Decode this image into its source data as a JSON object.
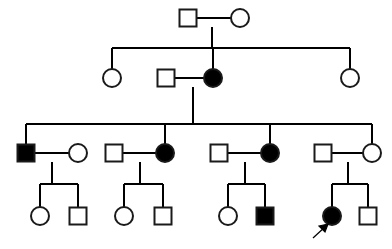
{
  "diagram": {
    "kind": "pedigree-chart",
    "title": "",
    "canvas": {
      "width": 392,
      "height": 249
    },
    "colors": {
      "background": "#ffffff",
      "line": "#000000",
      "symbol_stroke": "#1a1a1a",
      "affected_fill": "#000000",
      "unaffected_fill": "#ffffff"
    },
    "legend": {
      "square_meaning": "male",
      "circle_meaning": "female",
      "filled_meaning": "affected",
      "open_meaning": "unaffected",
      "arrow_meaning": "proband"
    },
    "generations": [
      {
        "id": "I",
        "label": "I",
        "y": 18,
        "individuals": [
          {
            "id": "I-1",
            "shape": "square",
            "sex": "male",
            "status": "unaffected",
            "cx": 188,
            "cy": 18
          },
          {
            "id": "I-2",
            "shape": "circle",
            "sex": "female",
            "status": "unaffected",
            "cx": 240,
            "cy": 18
          }
        ]
      },
      {
        "id": "II",
        "label": "II",
        "y": 78,
        "individuals": [
          {
            "id": "II-1",
            "shape": "circle",
            "sex": "female",
            "status": "unaffected",
            "cx": 112,
            "cy": 78
          },
          {
            "id": "II-2",
            "shape": "square",
            "sex": "male",
            "status": "unaffected",
            "cx": 166,
            "cy": 78
          },
          {
            "id": "II-3",
            "shape": "circle",
            "sex": "female",
            "status": "affected",
            "cx": 213,
            "cy": 78
          },
          {
            "id": "II-4",
            "shape": "circle",
            "sex": "female",
            "status": "unaffected",
            "cx": 350,
            "cy": 78
          }
        ]
      },
      {
        "id": "III",
        "label": "III",
        "y": 153,
        "individuals": [
          {
            "id": "III-1",
            "shape": "square",
            "sex": "male",
            "status": "affected",
            "cx": 26,
            "cy": 153
          },
          {
            "id": "III-2",
            "shape": "circle",
            "sex": "female",
            "status": "unaffected",
            "cx": 78,
            "cy": 153
          },
          {
            "id": "III-3",
            "shape": "square",
            "sex": "male",
            "status": "unaffected",
            "cx": 114,
            "cy": 153
          },
          {
            "id": "III-4",
            "shape": "circle",
            "sex": "female",
            "status": "affected",
            "cx": 165,
            "cy": 153
          },
          {
            "id": "III-5",
            "shape": "square",
            "sex": "male",
            "status": "unaffected",
            "cx": 219,
            "cy": 153
          },
          {
            "id": "III-6",
            "shape": "circle",
            "sex": "female",
            "status": "affected",
            "cx": 270,
            "cy": 153
          },
          {
            "id": "III-7",
            "shape": "square",
            "sex": "male",
            "status": "unaffected",
            "cx": 323,
            "cy": 153
          },
          {
            "id": "III-8",
            "shape": "circle",
            "sex": "female",
            "status": "unaffected",
            "cx": 372,
            "cy": 153
          }
        ]
      },
      {
        "id": "IV",
        "label": "IV",
        "y": 216,
        "individuals": [
          {
            "id": "IV-1",
            "shape": "circle",
            "sex": "female",
            "status": "unaffected",
            "cx": 40,
            "cy": 216
          },
          {
            "id": "IV-2",
            "shape": "square",
            "sex": "male",
            "status": "unaffected",
            "cx": 78,
            "cy": 216
          },
          {
            "id": "IV-3",
            "shape": "circle",
            "sex": "female",
            "status": "unaffected",
            "cx": 124,
            "cy": 216
          },
          {
            "id": "IV-4",
            "shape": "square",
            "sex": "male",
            "status": "unaffected",
            "cx": 163,
            "cy": 216
          },
          {
            "id": "IV-5",
            "shape": "circle",
            "sex": "female",
            "status": "unaffected",
            "cx": 228,
            "cy": 216
          },
          {
            "id": "IV-6",
            "shape": "square",
            "sex": "male",
            "status": "affected",
            "cx": 265,
            "cy": 216
          },
          {
            "id": "IV-7",
            "shape": "circle",
            "sex": "female",
            "status": "affected",
            "cx": 332,
            "cy": 216,
            "proband": true
          },
          {
            "id": "IV-8",
            "shape": "square",
            "sex": "male",
            "status": "unaffected",
            "cx": 368,
            "cy": 216
          }
        ]
      }
    ],
    "matings": [
      {
        "id": "mating-I",
        "left": "I-1",
        "right": "I-2",
        "y": 18,
        "x1": 197,
        "x2": 231,
        "drop_x": 212
      },
      {
        "id": "mating-II",
        "left": "II-2",
        "right": "II-3",
        "y": 78,
        "x1": 175,
        "x2": 204,
        "drop_x": 193
      },
      {
        "id": "mating-III-a",
        "left": "III-1",
        "right": "III-2",
        "y": 153,
        "x1": 35,
        "x2": 69,
        "drop_x": 52
      },
      {
        "id": "mating-III-b",
        "left": "III-3",
        "right": "III-4",
        "y": 153,
        "x1": 123,
        "x2": 156,
        "drop_x": 140
      },
      {
        "id": "mating-III-c",
        "left": "III-5",
        "right": "III-6",
        "y": 153,
        "x1": 228,
        "x2": 261,
        "drop_x": 245
      },
      {
        "id": "mating-III-d",
        "left": "III-7",
        "right": "III-8",
        "y": 153,
        "x1": 332,
        "x2": 363,
        "drop_x": 348
      }
    ],
    "sibships": [
      {
        "id": "sibship-II",
        "parent_drop_x": 212,
        "parent_drop_y0": 27,
        "bar_y": 48,
        "bar_x1": 112,
        "bar_x2": 350,
        "children_x": [
          112,
          213,
          350
        ]
      },
      {
        "id": "sibship-III",
        "parent_drop_x": 193,
        "parent_drop_y0": 87,
        "bar_y": 124,
        "bar_x1": 26,
        "bar_x2": 372,
        "children_x": [
          26,
          165,
          270,
          372
        ]
      },
      {
        "id": "sibship-IV-a",
        "parent_drop_x": 52,
        "parent_drop_y0": 162,
        "bar_y": 184,
        "bar_x1": 40,
        "bar_x2": 78,
        "children_x": [
          40,
          78
        ]
      },
      {
        "id": "sibship-IV-b",
        "parent_drop_x": 140,
        "parent_drop_y0": 162,
        "bar_y": 184,
        "bar_x1": 124,
        "bar_x2": 163,
        "children_x": [
          124,
          163
        ]
      },
      {
        "id": "sibship-IV-c",
        "parent_drop_x": 245,
        "parent_drop_y0": 162,
        "bar_y": 184,
        "bar_x1": 228,
        "bar_x2": 265,
        "children_x": [
          228,
          265
        ]
      },
      {
        "id": "sibship-IV-d",
        "parent_drop_x": 348,
        "parent_drop_y0": 162,
        "bar_y": 184,
        "bar_x1": 332,
        "bar_x2": 368,
        "children_x": [
          332,
          368
        ]
      }
    ],
    "proband": {
      "target_id": "IV-7",
      "arrow_tail": {
        "x": 313,
        "y": 238
      },
      "arrow_head": {
        "x": 326,
        "y": 226
      }
    },
    "symbol_size": {
      "square_side": 17,
      "circle_radius": 9
    }
  }
}
